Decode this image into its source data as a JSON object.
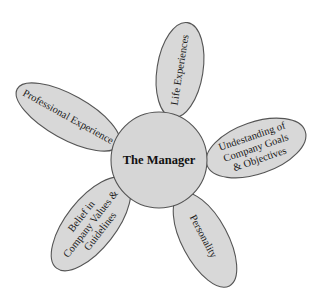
{
  "diagram": {
    "center": {
      "label": "The Manager"
    },
    "petals": [
      {
        "id": "professional",
        "lines": [
          "Professional Experience"
        ]
      },
      {
        "id": "life",
        "lines": [
          "Life Experiences"
        ]
      },
      {
        "id": "understanding",
        "lines": [
          "Undestanding of",
          "Company Goals",
          "& Objectives"
        ]
      },
      {
        "id": "personality",
        "lines": [
          "Personality"
        ]
      },
      {
        "id": "belief",
        "lines": [
          "Belief in",
          "Company Values &",
          "Guidelines"
        ]
      }
    ]
  },
  "colors": {
    "petal_fill": "#d8d8d8",
    "stroke": "#555555",
    "background": "#ffffff"
  }
}
